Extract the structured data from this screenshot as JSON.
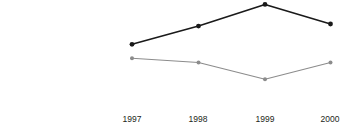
{
  "chart_data": {
    "type": "line",
    "title": "",
    "subtitle": "",
    "xlabel": "",
    "ylabel": "",
    "categories": [
      "1997",
      "1998",
      "1999",
      "2000"
    ],
    "y_tick_labels": [
      "$225,000",
      "$200,000",
      "$175,000",
      "$150,000",
      "$125,000",
      "$100,000"
    ],
    "y_tick_values": [
      225000,
      200000,
      175000,
      150000,
      125000,
      100000
    ],
    "ylim": [
      100000,
      237000
    ],
    "grid": false,
    "legend": "none",
    "series": [
      {
        "name": "series-dark",
        "color": "#1a1a1a",
        "marker": "circle",
        "values": [
          176000,
          202000,
          233000,
          205000
        ]
      },
      {
        "name": "series-gray",
        "color": "#8c8c8c",
        "marker": "circle",
        "values": [
          156000,
          150000,
          126000,
          150000
        ]
      }
    ],
    "annotations": []
  },
  "layout": {
    "plot_x_positions": [
      132,
      198.5,
      265,
      330.5
    ],
    "y_top_label_center": 10,
    "y_label_spacing": 17.5
  }
}
